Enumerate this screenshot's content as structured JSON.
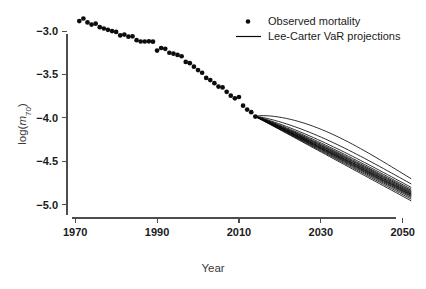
{
  "chart_data": {
    "type": "scatter",
    "title": "",
    "xlabel": "Year",
    "ylabel": "log(m70)",
    "ylabel_parts": {
      "prefix": "log(",
      "italic": "m",
      "subscript": "70",
      "suffix": ")"
    },
    "xlim": [
      1968,
      2053
    ],
    "ylim": [
      -5.12,
      -2.78
    ],
    "xticks": [
      1970,
      1990,
      2010,
      2030,
      2050
    ],
    "xtick_labels": [
      "1970",
      "1990",
      "2010",
      "2030",
      "2050"
    ],
    "yticks": [
      -3.0,
      -3.5,
      -4.0,
      -4.5,
      -5.0
    ],
    "ytick_labels": [
      "-3.0",
      "-3.5",
      "-4.0",
      "-4.5",
      "-5.0"
    ],
    "grid": false,
    "legend_position": "top-right",
    "legend": [
      {
        "label": "Observed mortality",
        "marker": "point",
        "color": "#0d0d0d"
      },
      {
        "label": "Lee-Carter VaR projections",
        "marker": "line",
        "color": "#0a0a0a"
      }
    ],
    "series": [
      {
        "name": "Observed mortality",
        "type": "scatter",
        "marker": "point",
        "color": "#0d0d0d",
        "x": [
          1971,
          1972,
          1973,
          1974,
          1975,
          1976,
          1977,
          1978,
          1979,
          1980,
          1981,
          1982,
          1983,
          1984,
          1985,
          1986,
          1987,
          1988,
          1989,
          1990,
          1991,
          1992,
          1993,
          1994,
          1995,
          1996,
          1997,
          1998,
          1999,
          2000,
          2001,
          2002,
          2003,
          2004,
          2005,
          2006,
          2007,
          2008,
          2009,
          2010,
          2011,
          2012,
          2013,
          2014
        ],
        "y": [
          -2.885,
          -2.855,
          -2.9,
          -2.925,
          -2.915,
          -2.955,
          -2.97,
          -2.985,
          -3.0,
          -3.01,
          -3.05,
          -3.04,
          -3.065,
          -3.06,
          -3.105,
          -3.12,
          -3.12,
          -3.118,
          -3.122,
          -3.225,
          -3.195,
          -3.205,
          -3.25,
          -3.26,
          -3.275,
          -3.29,
          -3.355,
          -3.37,
          -3.41,
          -3.45,
          -3.48,
          -3.54,
          -3.565,
          -3.6,
          -3.64,
          -3.65,
          -3.7,
          -3.745,
          -3.775,
          -3.76,
          -3.86,
          -3.905,
          -3.935,
          -3.985
        ]
      },
      {
        "name": "Lee-Carter VaR projections",
        "type": "line",
        "color": "#0a0a0a",
        "start_year": 2014,
        "end_year": 2052,
        "start_value": -3.985,
        "end_values": [
          -4.7,
          -4.76,
          -4.8,
          -4.82,
          -4.835,
          -4.845,
          -4.855,
          -4.865,
          -4.872,
          -4.88,
          -4.888,
          -4.895,
          -4.905,
          -4.918,
          -4.935,
          -4.955
        ],
        "curvature": [
          0.155,
          0.09,
          0.062,
          0.048,
          0.04,
          0.034,
          0.03,
          0.026,
          0.022,
          0.019,
          0.016,
          0.013,
          0.01,
          0.007,
          0.004,
          0.001
        ]
      }
    ]
  },
  "axes_geometry": {
    "plot_left": 67,
    "plot_right": 415,
    "plot_top": 12,
    "plot_bottom": 215,
    "x_axis_y": 218,
    "y_axis_x": 67,
    "y_axis_top": 34,
    "y_axis_bottom": 215,
    "x_axis_left": 72,
    "x_axis_right": 396
  },
  "labels": {
    "x_axis_title": "Year",
    "y_axis_title": "log(m70)"
  }
}
